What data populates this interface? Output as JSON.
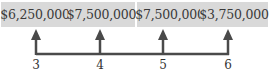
{
  "diagram": {
    "type": "cash-flow-timeline",
    "color_line": "#4a4a4a",
    "color_box": "#d9d9d9",
    "cash_flows": [
      {
        "period": "3",
        "amount": "$6,250,000"
      },
      {
        "period": "4",
        "amount": "$7,500,000"
      },
      {
        "period": "5",
        "amount": "$7,500,000"
      },
      {
        "period": "6",
        "amount": "$3,750,000"
      }
    ]
  }
}
